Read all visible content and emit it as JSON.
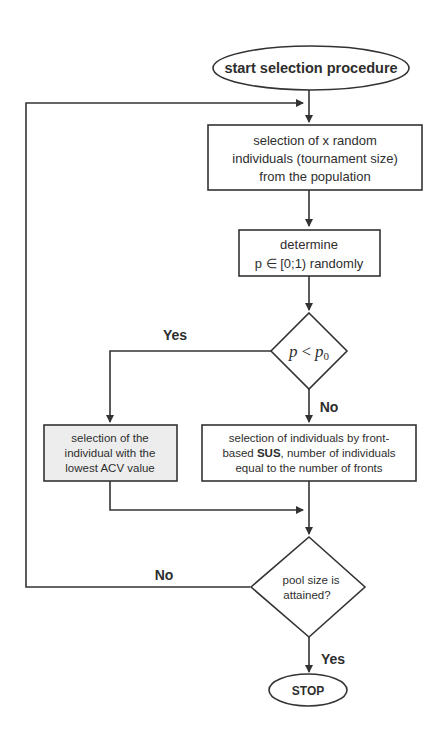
{
  "diagram": {
    "type": "flowchart",
    "nodes": {
      "start": {
        "shape": "ellipse",
        "label": "start selection procedure"
      },
      "select_random": {
        "shape": "rect",
        "lines": [
          "selection of x random",
          "individuals (tournament size)",
          "from the population"
        ]
      },
      "determine_p": {
        "shape": "rect",
        "lines": [
          "determine",
          "p ∈ [0;1)  randomly"
        ]
      },
      "decision_p": {
        "shape": "diamond",
        "label_p": "p",
        "label_op": "<",
        "label_p0": "p",
        "label_sub": "0"
      },
      "select_lowest": {
        "shape": "rect",
        "fill": "#ededed",
        "lines": [
          "selection of the",
          "individual with the",
          "lowest ACV value"
        ]
      },
      "select_sus": {
        "shape": "rect",
        "lines_pre": "selection of individuals by front-",
        "line2_a": "based ",
        "line2_bold": "SUS",
        "line2_b": ", number of individuals",
        "line3": "equal to the number of fronts"
      },
      "decision_pool": {
        "shape": "diamond",
        "lines": [
          "pool size is",
          "attained?"
        ]
      },
      "stop": {
        "shape": "ellipse",
        "label": "STOP"
      }
    },
    "edge_labels": {
      "decision_p_yes": "Yes",
      "decision_p_no": "No",
      "decision_pool_no": "No",
      "decision_pool_yes": "Yes"
    },
    "colors": {
      "stroke": "#333333",
      "background": "#ffffff",
      "shaded_box": "#ededed"
    }
  }
}
